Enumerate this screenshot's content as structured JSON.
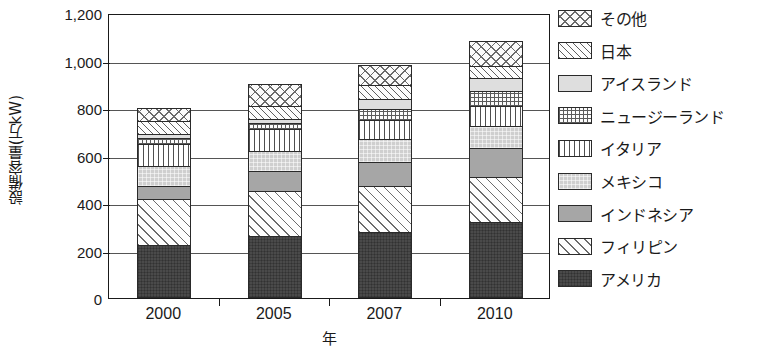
{
  "chart_data": {
    "type": "bar",
    "stacked": true,
    "title": "",
    "xlabel": "年",
    "ylabel": "設備容量(万kW)",
    "categories": [
      "2000",
      "2005",
      "2007",
      "2010"
    ],
    "ylim": [
      0,
      1200
    ],
    "ytick_values": [
      1200,
      1000,
      800,
      600,
      400,
      200,
      0
    ],
    "ytick_labels": [
      "1,200",
      "1,000",
      "800",
      "600",
      "400",
      "200",
      "0"
    ],
    "grid": true,
    "legend_position": "right",
    "stack_order_bottom_to_top": [
      "アメリカ",
      "フィリピン",
      "インドネシア",
      "メキシコ",
      "イタリア",
      "ニュージーランド",
      "アイスランド",
      "日本",
      "その他"
    ],
    "series": [
      {
        "name": "その他",
        "pattern": "cross-hatch",
        "values": [
          55,
          90,
          87,
          107
        ]
      },
      {
        "name": "日本",
        "pattern": "diagonal-dense",
        "values": [
          55,
          55,
          55,
          50
        ]
      },
      {
        "name": "アイスランド",
        "pattern": "solid-very-light",
        "values": [
          15,
          20,
          45,
          55
        ]
      },
      {
        "name": "ニュージーランド",
        "pattern": "fine-grid",
        "values": [
          25,
          25,
          45,
          60
        ]
      },
      {
        "name": "イタリア",
        "pattern": "vertical-lines",
        "values": [
          95,
          90,
          82,
          85
        ]
      },
      {
        "name": "メキシコ",
        "pattern": "solid-light",
        "values": [
          85,
          85,
          95,
          95
        ]
      },
      {
        "name": "インドネシア",
        "pattern": "solid-medium-gray",
        "values": [
          55,
          85,
          100,
          120
        ]
      },
      {
        "name": "フィリピン",
        "pattern": "diagonal-sparse",
        "values": [
          190,
          188,
          195,
          190
        ]
      },
      {
        "name": "アメリカ",
        "pattern": "solid-dark",
        "values": [
          225,
          262,
          278,
          320
        ]
      }
    ],
    "totals": [
      800,
      900,
      982,
      1082
    ]
  },
  "legend": {
    "items": [
      {
        "label": "その他",
        "swatch": "cross-hatch-swatch"
      },
      {
        "label": "日本",
        "swatch": "diagonal-dense-swatch"
      },
      {
        "label": "アイスランド",
        "swatch": "solid-very-light-swatch"
      },
      {
        "label": "ニュージーランド",
        "swatch": "fine-grid-swatch"
      },
      {
        "label": "イタリア",
        "swatch": "vertical-lines-swatch"
      },
      {
        "label": "メキシコ",
        "swatch": "solid-light-swatch"
      },
      {
        "label": "インドネシア",
        "swatch": "solid-medium-swatch"
      },
      {
        "label": "フィリピン",
        "swatch": "diagonal-sparse-swatch"
      },
      {
        "label": "アメリカ",
        "swatch": "solid-dark-swatch"
      }
    ]
  },
  "colors": {
    "axis": "#1a1a1a",
    "gridline": "#555555",
    "america": "#4a4a4a",
    "indonesia": "#a6a6a6",
    "mexico": "#cfcfcf",
    "iceland": "#dedede",
    "background": "#ffffff"
  }
}
